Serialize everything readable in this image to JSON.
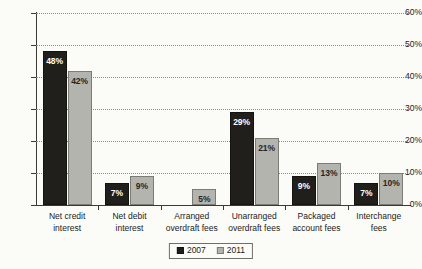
{
  "chart_data": {
    "type": "bar",
    "title": "",
    "subtitle": "",
    "xlabel": "",
    "ylabel": "",
    "ylim": [
      0,
      60
    ],
    "y_tick_labels": [
      "0%",
      "10%",
      "20%",
      "30%",
      "40%",
      "50%",
      "60%"
    ],
    "y_tick_values": [
      0,
      10,
      20,
      30,
      40,
      50,
      60
    ],
    "grid": true,
    "grid_style": "dotted-horizontal",
    "legend_position": "bottom-center",
    "value_suffix": "%",
    "categories": [
      "Net credit interest",
      "Net debit interest",
      "Arranged overdraft fees",
      "Unarranged overdraft fees",
      "Packaged account fees",
      "Interchange fees"
    ],
    "category_lines": [
      [
        "Net credit",
        "interest"
      ],
      [
        "Net debit",
        "interest"
      ],
      [
        "Arranged",
        "overdraft fees"
      ],
      [
        "Unarranged",
        "overdraft fees"
      ],
      [
        "Packaged",
        "account fees"
      ],
      [
        "Interchange",
        "fees"
      ]
    ],
    "series": [
      {
        "name": "2007",
        "color": "#211f1c",
        "values": [
          48,
          7,
          null,
          29,
          9,
          7
        ],
        "labels": [
          "48%",
          "7%",
          "",
          "29%",
          "9%",
          "7%"
        ]
      },
      {
        "name": "2011",
        "color": "#b4b4af",
        "values": [
          42,
          9,
          5,
          21,
          13,
          10
        ],
        "labels": [
          "42%",
          "9%",
          "5%",
          "21%",
          "13%",
          "10%"
        ]
      }
    ]
  },
  "legend": {
    "items": [
      {
        "label": "2007",
        "swatch": "s2007"
      },
      {
        "label": "2011",
        "swatch": "s2011"
      }
    ]
  },
  "colors": {
    "series_2007": "#211f1c",
    "series_2011": "#b4b4af",
    "axis": "#3a3a34",
    "grid": "#8d8d86",
    "background": "#fbfbf8",
    "text": "#1b1b18"
  }
}
